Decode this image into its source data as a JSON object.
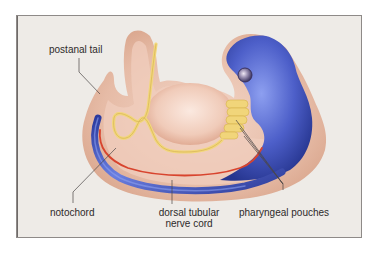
{
  "diagram": {
    "labels": {
      "postanal_tail": "postanal tail",
      "notochord": "notochord",
      "nerve_cord_line1": "dorsal tubular",
      "nerve_cord_line2": "nerve cord",
      "pharyngeal_pouches": "pharyngeal pouches"
    },
    "colors": {
      "background": "#eeebe7",
      "frame_border": "#8e8a88",
      "body_outer": "#e2b49c",
      "body_inner": "#f0cdbd",
      "nerve_cord": "#3b4fb3",
      "notochord": "#d8442e",
      "gut": "#f2d77a",
      "eye": "#6b6186",
      "leader_line": "#4a4646",
      "label_text": "#2d2a2a"
    }
  }
}
